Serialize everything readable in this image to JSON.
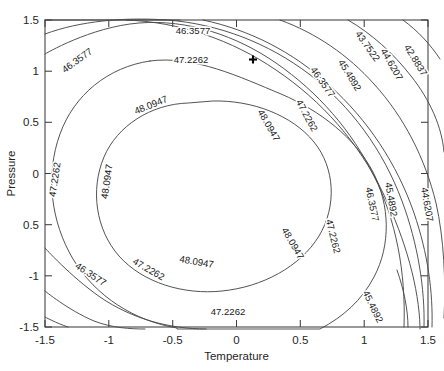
{
  "chart_data": {
    "type": "contour",
    "title": "",
    "xlabel": "Temperature",
    "ylabel": "Pressure",
    "xlim": [
      -1.5,
      1.5
    ],
    "ylim": [
      -1.5,
      1.5
    ],
    "xticks": [
      -1.5,
      -1,
      -0.5,
      0,
      0.5,
      1,
      1.5
    ],
    "xtick_labels": [
      "-1.5",
      "-1",
      "-0.5",
      "0",
      "0.5",
      "1",
      "1.5"
    ],
    "yticks": [
      -1.5,
      -1,
      -0.5,
      0,
      0.5,
      1,
      1.5
    ],
    "ytick_labels": [
      "-1.5",
      "-1",
      "0.5",
      "0",
      "0.5",
      "1",
      "1.5"
    ],
    "grid": false,
    "legend": "none",
    "levels": [
      42.8837,
      43.7522,
      44.6207,
      45.4892,
      46.3577,
      47.2262,
      48.0947
    ],
    "level_labels": [
      "42.8837",
      "43.7522",
      "44.6207",
      "45.4892",
      "46.3577",
      "47.2262",
      "48.0947"
    ],
    "level_step": 0.8685,
    "maximum_level": 48.0947,
    "surface_center": [
      -0.25,
      0.3
    ],
    "markers": [
      {
        "name": "design-point",
        "x": 0.28,
        "y": 1.1,
        "glyph": "plus"
      }
    ],
    "contour_labels": [
      {
        "text": "46.3577",
        "x": 79,
        "y": 63,
        "rot": -36
      },
      {
        "text": "46.3577",
        "x": 193,
        "y": 34,
        "rot": 0
      },
      {
        "text": "47.2262",
        "x": 191,
        "y": 63,
        "rot": 0
      },
      {
        "text": "48.0947",
        "x": 152,
        "y": 108,
        "rot": -22
      },
      {
        "text": "47.2262",
        "x": 58,
        "y": 180,
        "rot": -82
      },
      {
        "text": "48.0947",
        "x": 110,
        "y": 182,
        "rot": -82
      },
      {
        "text": "48.0947",
        "x": 266,
        "y": 127,
        "rot": 60
      },
      {
        "text": "47.2262",
        "x": 304,
        "y": 117,
        "rot": 62
      },
      {
        "text": "46.3577",
        "x": 320,
        "y": 84,
        "rot": 55
      },
      {
        "text": "45.4892",
        "x": 347,
        "y": 77,
        "rot": 58
      },
      {
        "text": "43.7522",
        "x": 365,
        "y": 48,
        "rot": 55
      },
      {
        "text": "44.6207",
        "x": 389,
        "y": 66,
        "rot": 60
      },
      {
        "text": "42.8837",
        "x": 413,
        "y": 62,
        "rot": 58
      },
      {
        "text": "48.0947",
        "x": 290,
        "y": 245,
        "rot": 60
      },
      {
        "text": "47.2262",
        "x": 330,
        "y": 237,
        "rot": 76
      },
      {
        "text": "46.3577",
        "x": 369,
        "y": 205,
        "rot": 78
      },
      {
        "text": "45.4892",
        "x": 388,
        "y": 200,
        "rot": 80
      },
      {
        "text": "44.6207",
        "x": 424,
        "y": 205,
        "rot": 80
      },
      {
        "text": "45.4892",
        "x": 370,
        "y": 308,
        "rot": 64
      },
      {
        "text": "46.3577",
        "x": 89,
        "y": 277,
        "rot": 33
      },
      {
        "text": "47.2262",
        "x": 147,
        "y": 272,
        "rot": 30
      },
      {
        "text": "48.0947",
        "x": 196,
        "y": 265,
        "rot": 10
      },
      {
        "text": "47.2262",
        "x": 228,
        "y": 315,
        "rot": 0
      }
    ]
  },
  "axes": {
    "x_title": "Temperature",
    "y_title": "Pressure"
  }
}
